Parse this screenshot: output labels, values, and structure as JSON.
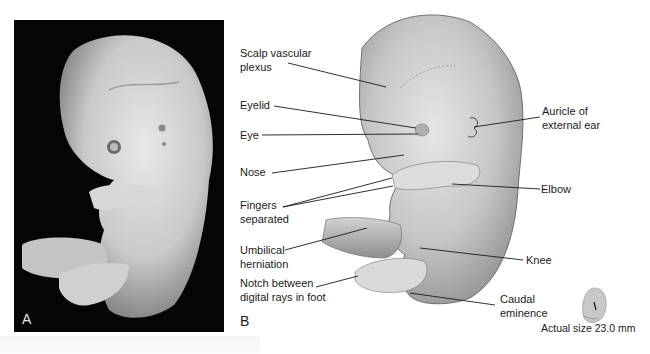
{
  "figure": {
    "panels": [
      {
        "id": "A",
        "letter": "A",
        "kind": "photograph",
        "description": "Embryo specimen photograph on black background"
      },
      {
        "id": "B",
        "letter": "B",
        "kind": "illustration",
        "description": "Labeled drawing of embryo, lateral view"
      }
    ],
    "labels": {
      "scalp_vascular_plexus": [
        "Scalp vascular",
        "plexus"
      ],
      "eyelid": "Eyelid",
      "eye": "Eye",
      "nose": "Nose",
      "fingers_separated": [
        "Fingers",
        "separated"
      ],
      "umbilical_herniation": [
        "Umbilical",
        "herniation"
      ],
      "notch_between_digital_rays": [
        "Notch between",
        "digital rays in foot"
      ],
      "auricle_external_ear": [
        "Auricle of",
        "external ear"
      ],
      "elbow": "Elbow",
      "knee": "Knee",
      "caudal_eminence": [
        "Caudal",
        "eminence"
      ]
    },
    "scale_reference": {
      "caption": "Actual size 23.0 mm"
    },
    "colors": {
      "photo_background": "#050505",
      "embryo_skin_light": "#e2e2e2",
      "embryo_skin_dark": "#8a8a8a",
      "leader_line": "#1a1a1a"
    }
  }
}
